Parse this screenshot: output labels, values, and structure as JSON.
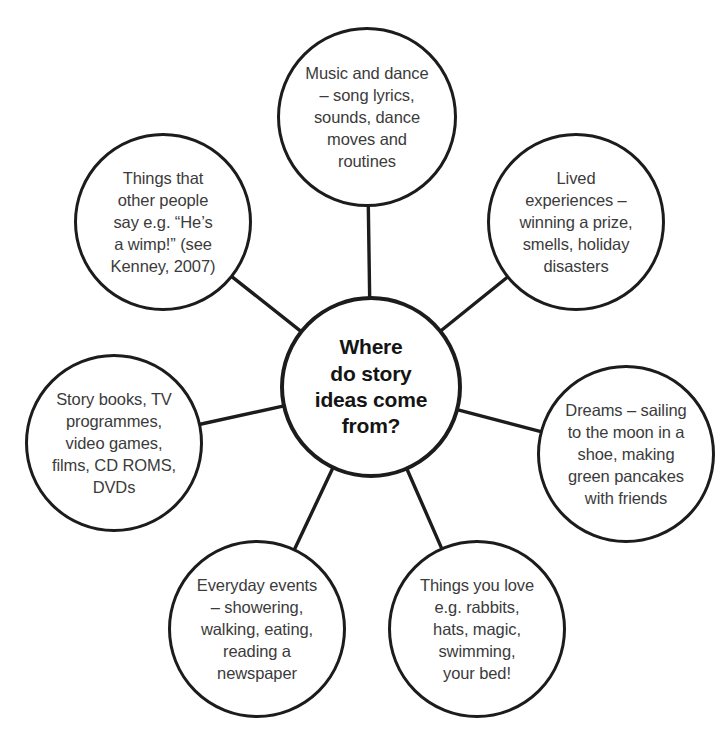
{
  "diagram": {
    "type": "mind-map",
    "title": "Where do story ideas come from?",
    "background_color": "#ffffff",
    "stroke_color": "#1c1c1c",
    "text_color": "#3b3b3b",
    "center": {
      "id": "center",
      "label": "Where\ndo story\nideas come\nfrom?",
      "cx": 371,
      "cy": 387,
      "r": 91
    },
    "nodes": [
      {
        "id": "music-and-dance",
        "label": "Music and dance\n– song lyrics,\nsounds, dance\nmoves and\nroutines",
        "cx": 367,
        "cy": 117,
        "r": 90
      },
      {
        "id": "things-other-people-say",
        "label": "Things that\nother people\nsay e.g. “He’s\na wimp!” (see\nKenney, 2007)",
        "cx": 163,
        "cy": 222,
        "r": 89
      },
      {
        "id": "lived-experiences",
        "label": "Lived\nexperiences –\nwinning a prize,\nsmells, holiday\ndisasters",
        "cx": 576,
        "cy": 222,
        "r": 89
      },
      {
        "id": "story-books-tv",
        "label": "Story books, TV\nprogrammes,\nvideo games,\nfilms, CD ROMS,\nDVDs",
        "cx": 114,
        "cy": 443,
        "r": 89
      },
      {
        "id": "dreams",
        "label": "Dreams – sailing\nto the moon in a\nshoe, making\ngreen pancakes\nwith friends",
        "cx": 626,
        "cy": 454,
        "r": 89
      },
      {
        "id": "everyday-events",
        "label": "Everyday events\n– showering,\nwalking, eating,\nreading a\nnewspaper",
        "cx": 257,
        "cy": 629,
        "r": 89
      },
      {
        "id": "things-you-love",
        "label": "Things you love\ne.g. rabbits,\nhats, magic,\nswimming,\nyour bed!",
        "cx": 477,
        "cy": 629,
        "r": 89
      }
    ]
  }
}
